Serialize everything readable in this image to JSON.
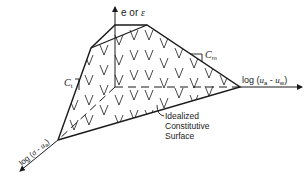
{
  "diagram": {
    "title": "Idealized constitutive surface",
    "axes": {
      "vertical": {
        "text_prefix": "e or ",
        "text_symbol": "ε"
      },
      "horizontal": {
        "text_prefix": "log (",
        "sym1": "u",
        "sub1": "a",
        "minus": " - ",
        "sym2": "u",
        "sub2": "w",
        "text_suffix": ")"
      },
      "diagonal": {
        "text_prefix": "log (",
        "sym1": "σ",
        "minus": " - ",
        "sym2": "u",
        "sub2": "a",
        "text_suffix": ")"
      }
    },
    "slopes": {
      "ct": {
        "letter": "C",
        "sub": "t"
      },
      "cm": {
        "letter": "C",
        "sub": "m"
      }
    },
    "surface_label": {
      "line1": "Idealized",
      "line2": "Constitutive",
      "line3": "Surface"
    },
    "colors": {
      "ink": "#1a1a1a",
      "background": "#ffffff"
    }
  }
}
